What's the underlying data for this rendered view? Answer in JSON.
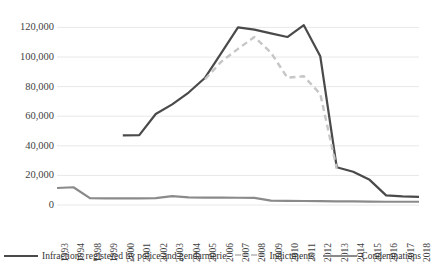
{
  "chart_data": {
    "type": "line",
    "title": "",
    "xlabel": "",
    "ylabel": "",
    "categories": [
      "1993",
      "1994",
      "1998",
      "1999",
      "2000",
      "2001",
      "2002",
      "2003",
      "2004",
      "2005",
      "2006",
      "2007",
      "2008",
      "2009",
      "2010",
      "2011",
      "2012",
      "2013",
      "2014",
      "2015",
      "2016",
      "2017",
      "2018"
    ],
    "ylim": [
      0,
      125000
    ],
    "yticks": [
      0,
      20000,
      40000,
      60000,
      80000,
      100000,
      120000
    ],
    "ytick_labels": [
      "0",
      "20,000",
      "40,000",
      "60,000",
      "80,000",
      "100,000",
      "120,000"
    ],
    "grid": true,
    "legend_position": "bottom",
    "series": [
      {
        "name": "Infractions registered by police and gendarmerie",
        "style": "solid",
        "color": "#4a4a4a",
        "values": [
          null,
          null,
          null,
          null,
          47000,
          47200,
          61500,
          68000,
          76000,
          86000,
          103000,
          120000,
          118500,
          116000,
          113500,
          121500,
          100500,
          25500,
          22500,
          17000,
          6500,
          5800,
          5500
        ]
      },
      {
        "name": "Indictments",
        "style": "dashed",
        "color": "#c6c6c6",
        "values": [
          null,
          null,
          null,
          null,
          null,
          null,
          null,
          null,
          null,
          85000,
          97000,
          105500,
          113500,
          103000,
          86000,
          87000,
          75000,
          24500,
          null,
          null,
          null,
          null,
          null
        ]
      },
      {
        "name": "Condemnations",
        "style": "solid",
        "color": "#8a8a8a",
        "values": [
          11500,
          12000,
          4600,
          4500,
          4500,
          4500,
          4600,
          6000,
          5200,
          5000,
          5000,
          4900,
          4800,
          3000,
          2800,
          2700,
          2600,
          2500,
          2400,
          2300,
          2200,
          2200,
          2200
        ]
      }
    ]
  },
  "legend": {
    "entries": [
      {
        "label": "Infractions registered by police and gendarmerie",
        "swatch": "solid-dark"
      },
      {
        "label": "Indictments",
        "swatch": "dashed-light"
      },
      {
        "label": "Condemnations",
        "swatch": "solid-gray"
      }
    ]
  },
  "colors": {
    "infractions": "#4a4a4a",
    "indictments": "#c6c6c6",
    "condemnations": "#8a8a8a",
    "gridline": "#e8e8e8",
    "text": "#3f3f3f",
    "background": "#ffffff"
  }
}
